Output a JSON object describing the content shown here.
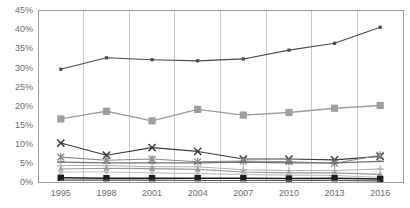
{
  "chart_data": {
    "type": "line",
    "title": "",
    "subtitle": "",
    "xlabel": "",
    "ylabel": "",
    "categories": [
      "1995",
      "1998",
      "2001",
      "2004",
      "2007",
      "2010",
      "2013",
      "2016"
    ],
    "ylim": [
      0,
      45
    ],
    "ytick_labels": [
      "0%",
      "5%",
      "10%",
      "15%",
      "20%",
      "25%",
      "30%",
      "35%",
      "40%",
      "45%"
    ],
    "ytick_values": [
      0,
      5,
      10,
      15,
      20,
      25,
      30,
      35,
      40,
      45
    ],
    "grid": "vertical",
    "legend": "none",
    "value_suffix": "%",
    "series": [
      {
        "name": "series-1",
        "color": "#4a4a4a",
        "marker": "square-small",
        "values": [
          29.5,
          32.5,
          32.0,
          31.7,
          32.2,
          34.5,
          36.3,
          40.5
        ]
      },
      {
        "name": "series-2",
        "color": "#9e9e9e",
        "marker": "square-large",
        "values": [
          16.5,
          18.5,
          16.0,
          19.0,
          17.5,
          18.2,
          19.3,
          20.0
        ]
      },
      {
        "name": "series-3",
        "color": "#3c3c3c",
        "marker": "x",
        "values": [
          10.2,
          7.0,
          9.0,
          8.0,
          6.0,
          6.0,
          5.8,
          6.7
        ]
      },
      {
        "name": "series-4",
        "color": "#8a8a8a",
        "marker": "asterisk",
        "values": [
          6.5,
          5.7,
          6.0,
          5.3,
          5.5,
          5.3,
          4.9,
          7.0
        ]
      },
      {
        "name": "series-5",
        "color": "#707070",
        "marker": "dash",
        "values": [
          5.2,
          5.0,
          5.0,
          5.0,
          5.2,
          5.0,
          5.0,
          5.4
        ]
      },
      {
        "name": "series-6",
        "color": "#b0b0b0",
        "marker": "plus",
        "values": [
          4.3,
          4.3,
          4.0,
          4.0,
          3.2,
          3.0,
          3.0,
          3.4
        ]
      },
      {
        "name": "series-7",
        "color": "#989898",
        "marker": "triangle",
        "values": [
          3.4,
          3.6,
          3.5,
          3.3,
          2.6,
          2.4,
          2.4,
          2.0
        ]
      },
      {
        "name": "series-8",
        "color": "#c2c2c2",
        "marker": "circle-small",
        "values": [
          2.6,
          2.6,
          2.4,
          2.2,
          2.0,
          1.8,
          1.7,
          1.2
        ]
      },
      {
        "name": "series-9",
        "color": "#1c1c1c",
        "marker": "square-filled",
        "values": [
          1.1,
          1.0,
          1.0,
          1.0,
          1.0,
          0.9,
          1.0,
          0.8
        ]
      },
      {
        "name": "series-10",
        "color": "#555555",
        "marker": "none",
        "values": [
          0.5,
          0.5,
          0.5,
          0.4,
          0.4,
          0.4,
          0.4,
          0.3
        ]
      }
    ]
  },
  "axes": {
    "y_axis_name": "y-axis",
    "x_axis_name": "x-axis"
  }
}
